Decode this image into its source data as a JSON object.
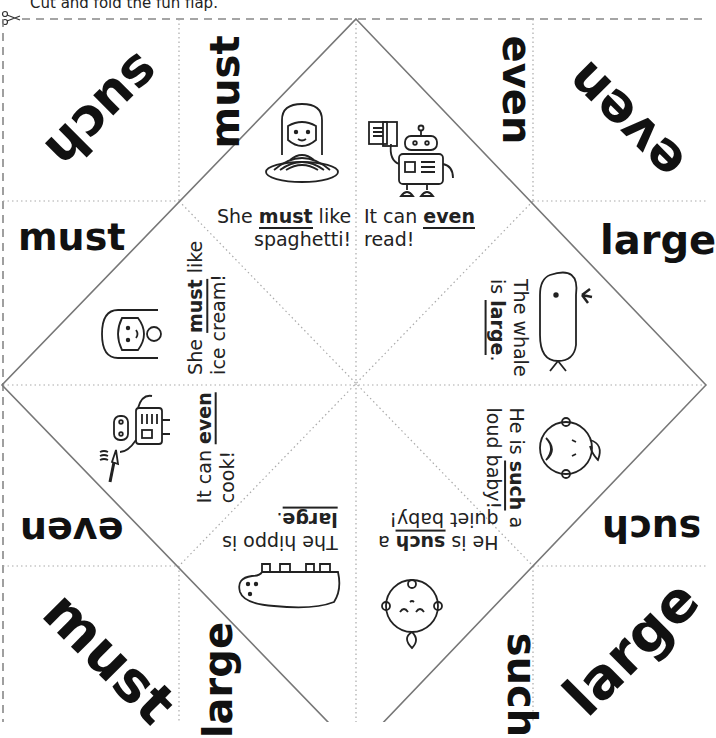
{
  "header": {
    "instruction": "Cut and fold the fun flap.",
    "icon": "scissors-icon"
  },
  "colors": {
    "text": "#111111",
    "fold_line": "#777777",
    "dotted_line": "#aaaaaa",
    "cut_line": "#888888"
  },
  "corner_words": {
    "top_left_diag": "such",
    "top_left_vert": "must",
    "top_right_vert": "even",
    "top_right_diag": "even",
    "left_upper": "must",
    "right_upper": "large",
    "left_lower": "even",
    "right_lower": "such",
    "bottom_left_diag": "must",
    "bottom_left_vert": "large",
    "bottom_right_vert": "such",
    "bottom_right_diag": "large"
  },
  "flaps": [
    {
      "id": "spaghetti",
      "pre": "She ",
      "word": "must",
      "post": " like",
      "line2": "spaghetti!",
      "picture": "girl-spaghetti-icon"
    },
    {
      "id": "read",
      "pre": "It can ",
      "word": "even",
      "post": "",
      "line2": "read!",
      "picture": "robot-book-icon"
    },
    {
      "id": "icecream",
      "pre": "She ",
      "word": "must",
      "post": " like",
      "line2": "ice cream!",
      "picture": "girl-icecream-icon"
    },
    {
      "id": "whale",
      "pre": "The whale",
      "word": "large",
      "line2_pre": "is ",
      "post": ".",
      "picture": "whale-icon"
    },
    {
      "id": "cook",
      "pre": "It can ",
      "word": "even",
      "post": "",
      "line2": "cook!",
      "picture": "robot-pan-icon"
    },
    {
      "id": "loudbaby",
      "pre": "He is ",
      "word": "such",
      "post": " a",
      "line2": "loud baby!",
      "picture": "crying-baby-icon"
    },
    {
      "id": "hippo",
      "pre": "The hippo is",
      "word": "large",
      "post": ".",
      "picture": "hippo-icon"
    },
    {
      "id": "quietbaby",
      "pre": "He is ",
      "word": "such",
      "post": " a",
      "line2": "quiet baby!",
      "picture": "sleeping-baby-icon"
    }
  ]
}
